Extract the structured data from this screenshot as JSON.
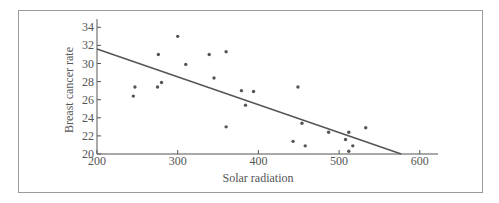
{
  "chart_data": {
    "type": "scatter",
    "title": "",
    "xlabel": "Solar radiation",
    "ylabel": "Breast cancer rate",
    "xlim": [
      200,
      620
    ],
    "ylim": [
      20,
      35
    ],
    "xticks": [
      200,
      300,
      400,
      500,
      600
    ],
    "yticks": [
      20,
      22,
      24,
      26,
      28,
      30,
      32,
      34
    ],
    "grid": false,
    "legend": null,
    "series": [
      {
        "name": "observations",
        "type": "scatter",
        "points": [
          {
            "x": 245,
            "y": 26.4
          },
          {
            "x": 247,
            "y": 27.4
          },
          {
            "x": 275,
            "y": 27.4
          },
          {
            "x": 276,
            "y": 31.0
          },
          {
            "x": 280,
            "y": 27.9
          },
          {
            "x": 300,
            "y": 33.0
          },
          {
            "x": 310,
            "y": 29.9
          },
          {
            "x": 339,
            "y": 31.0
          },
          {
            "x": 345,
            "y": 28.4
          },
          {
            "x": 360,
            "y": 31.3
          },
          {
            "x": 360,
            "y": 23.0
          },
          {
            "x": 379,
            "y": 27.0
          },
          {
            "x": 384,
            "y": 25.4
          },
          {
            "x": 394,
            "y": 26.9
          },
          {
            "x": 443,
            "y": 21.4
          },
          {
            "x": 449,
            "y": 27.4
          },
          {
            "x": 454,
            "y": 23.4
          },
          {
            "x": 458,
            "y": 20.9
          },
          {
            "x": 487,
            "y": 22.4
          },
          {
            "x": 508,
            "y": 21.6
          },
          {
            "x": 512,
            "y": 22.4
          },
          {
            "x": 512,
            "y": 20.3
          },
          {
            "x": 517,
            "y": 20.9
          },
          {
            "x": 533,
            "y": 22.9
          }
        ]
      },
      {
        "name": "regression line",
        "type": "line",
        "points": [
          {
            "x": 200,
            "y": 31.6
          },
          {
            "x": 577,
            "y": 20.0
          }
        ]
      }
    ]
  },
  "colors": {
    "axis": "#555555",
    "points": "#555555",
    "line": "#555555",
    "frame": "#9a9a9a"
  }
}
